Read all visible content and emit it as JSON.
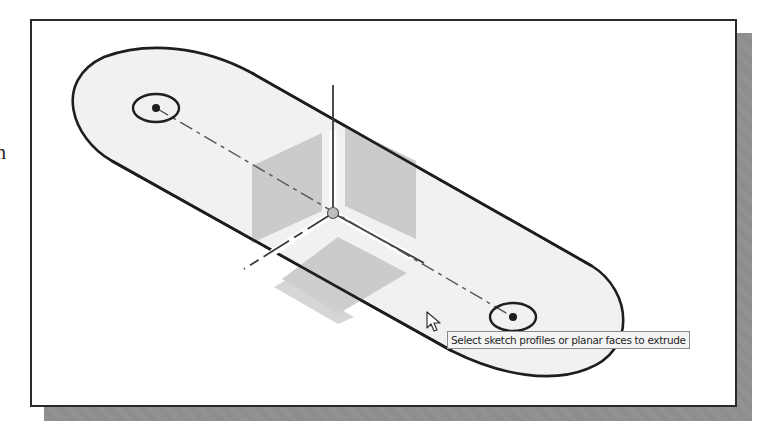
{
  "page": {
    "stray_text": "n"
  },
  "viewport": {
    "description": "CAD sketch viewport showing a slot-shaped profile with two circles and an origin triad",
    "colors": {
      "profile_fill": "#f1f1f1",
      "profile_stroke": "#1e1e1e",
      "plane_fill": "#c4c4c4",
      "axis_stroke": "#3a3a3a",
      "origin_fill": "#bdbdbd",
      "frame_border": "#2a2a2a",
      "shadow": "#8f8f8f"
    }
  },
  "tooltip": {
    "text": "Select sketch profiles or planar faces to extrude"
  },
  "cursor": {
    "icon": "arrow-pointer-icon"
  }
}
